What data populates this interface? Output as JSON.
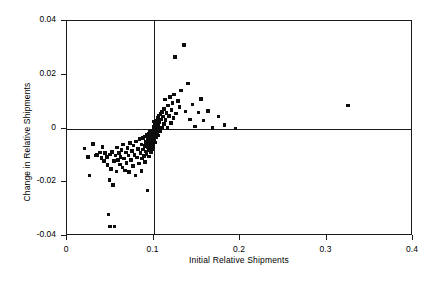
{
  "chart_data": {
    "type": "scatter",
    "title": "",
    "xlabel": "Initial Relative Shipments",
    "ylabel": "Change in Relative Shipments",
    "xlim": [
      0,
      0.4
    ],
    "ylim": [
      -0.04,
      0.04
    ],
    "xticks": [
      0,
      0.1,
      0.2,
      0.3,
      0.4
    ],
    "xticklabels": [
      "0",
      "0.1",
      "0.2",
      "0.3",
      "0.4"
    ],
    "yticks": [
      -0.04,
      -0.02,
      0,
      0.02,
      0.04
    ],
    "yticklabels": [
      "-0.04",
      "-0.02",
      "0",
      "0.02",
      "0.04"
    ],
    "grid": false,
    "legend": null,
    "marker": "square",
    "marker_color": "#0d0d0d",
    "reference_lines": [
      {
        "orientation": "vertical",
        "value": 0.1
      },
      {
        "orientation": "horizontal",
        "value": 0.0
      }
    ],
    "points": [
      [
        0.02,
        -0.0075
      ],
      [
        0.024,
        -0.0105
      ],
      [
        0.026,
        -0.0175
      ],
      [
        0.03,
        -0.0058
      ],
      [
        0.033,
        -0.01
      ],
      [
        0.035,
        -0.0098
      ],
      [
        0.038,
        -0.009
      ],
      [
        0.04,
        -0.011
      ],
      [
        0.041,
        -0.0068
      ],
      [
        0.043,
        -0.012
      ],
      [
        0.044,
        -0.0092
      ],
      [
        0.046,
        -0.0105
      ],
      [
        0.047,
        -0.0135
      ],
      [
        0.048,
        -0.032
      ],
      [
        0.049,
        -0.0192
      ],
      [
        0.05,
        -0.0365
      ],
      [
        0.05,
        -0.0096
      ],
      [
        0.051,
        -0.015
      ],
      [
        0.052,
        -0.0088
      ],
      [
        0.053,
        -0.021
      ],
      [
        0.054,
        -0.0122
      ],
      [
        0.055,
        -0.0365
      ],
      [
        0.056,
        -0.01
      ],
      [
        0.057,
        -0.016
      ],
      [
        0.058,
        -0.007
      ],
      [
        0.059,
        -0.0118
      ],
      [
        0.06,
        -0.0092
      ],
      [
        0.061,
        -0.0134
      ],
      [
        0.062,
        -0.0105
      ],
      [
        0.063,
        -0.008
      ],
      [
        0.064,
        -0.0145
      ],
      [
        0.065,
        -0.006
      ],
      [
        0.066,
        -0.0112
      ],
      [
        0.067,
        -0.0156
      ],
      [
        0.068,
        -0.009
      ],
      [
        0.069,
        -0.0128
      ],
      [
        0.07,
        -0.0072
      ],
      [
        0.071,
        -0.01
      ],
      [
        0.072,
        -0.0162
      ],
      [
        0.073,
        -0.0055
      ],
      [
        0.074,
        -0.0118
      ],
      [
        0.075,
        -0.0084
      ],
      [
        0.076,
        -0.014
      ],
      [
        0.077,
        -0.0064
      ],
      [
        0.078,
        -0.0098
      ],
      [
        0.079,
        -0.0175
      ],
      [
        0.08,
        -0.0048
      ],
      [
        0.081,
        -0.0108
      ],
      [
        0.082,
        -0.0076
      ],
      [
        0.083,
        -0.013
      ],
      [
        0.084,
        -0.004
      ],
      [
        0.085,
        -0.0092
      ],
      [
        0.086,
        -0.006
      ],
      [
        0.086,
        -0.0158
      ],
      [
        0.087,
        -0.0112
      ],
      [
        0.088,
        -0.0036
      ],
      [
        0.088,
        -0.0078
      ],
      [
        0.089,
        -0.0102
      ],
      [
        0.09,
        -0.003
      ],
      [
        0.09,
        -0.0066
      ],
      [
        0.09,
        -0.0125
      ],
      [
        0.091,
        -0.005
      ],
      [
        0.091,
        -0.0086
      ],
      [
        0.092,
        -0.0024
      ],
      [
        0.092,
        -0.0058
      ],
      [
        0.092,
        -0.0096
      ],
      [
        0.093,
        -0.004
      ],
      [
        0.093,
        -0.007
      ],
      [
        0.093,
        -0.023
      ],
      [
        0.094,
        -0.0018
      ],
      [
        0.094,
        -0.0052
      ],
      [
        0.094,
        -0.0082
      ],
      [
        0.095,
        -0.0032
      ],
      [
        0.095,
        -0.0062
      ],
      [
        0.095,
        -0.0104
      ],
      [
        0.096,
        -0.0012
      ],
      [
        0.096,
        -0.0044
      ],
      [
        0.096,
        -0.0074
      ],
      [
        0.097,
        -0.0026
      ],
      [
        0.097,
        -0.0056
      ],
      [
        0.097,
        -0.0088
      ],
      [
        0.098,
        -0.0008
      ],
      [
        0.098,
        -0.0038
      ],
      [
        0.098,
        -0.0066
      ],
      [
        0.099,
        -0.002
      ],
      [
        0.099,
        -0.0048
      ],
      [
        0.099,
        -0.0078
      ],
      [
        0.1,
        -0.0004
      ],
      [
        0.1,
        -0.003
      ],
      [
        0.1,
        -0.0058
      ],
      [
        0.1,
        0.0008
      ],
      [
        0.1,
        0.0026
      ],
      [
        0.101,
        -0.0014
      ],
      [
        0.101,
        -0.0042
      ],
      [
        0.101,
        0.0002
      ],
      [
        0.102,
        -0.0024
      ],
      [
        0.102,
        0.0014
      ],
      [
        0.102,
        -0.0052
      ],
      [
        0.103,
        -0.0006
      ],
      [
        0.103,
        0.002
      ],
      [
        0.103,
        -0.0034
      ],
      [
        0.104,
        0.0006
      ],
      [
        0.104,
        -0.0016
      ],
      [
        0.104,
        0.003
      ],
      [
        0.105,
        -0.0002
      ],
      [
        0.105,
        0.0038
      ],
      [
        0.105,
        -0.0026
      ],
      [
        0.106,
        0.0012
      ],
      [
        0.106,
        0.0046
      ],
      [
        0.107,
        0.0
      ],
      [
        0.107,
        0.0024
      ],
      [
        0.108,
        0.0054
      ],
      [
        0.108,
        -0.001
      ],
      [
        0.109,
        0.0034
      ],
      [
        0.11,
        0.0062
      ],
      [
        0.11,
        0.0004
      ],
      [
        0.111,
        0.0044
      ],
      [
        0.112,
        0.0016
      ],
      [
        0.112,
        0.0072
      ],
      [
        0.113,
        0.0108
      ],
      [
        0.114,
        0.0032
      ],
      [
        0.115,
        0.0058
      ],
      [
        0.116,
        0.0002
      ],
      [
        0.117,
        0.0086
      ],
      [
        0.118,
        0.0046
      ],
      [
        0.119,
        0.0118
      ],
      [
        0.12,
        0.002
      ],
      [
        0.121,
        0.0068
      ],
      [
        0.122,
        0.0094
      ],
      [
        0.123,
        0.004
      ],
      [
        0.124,
        0.0126
      ],
      [
        0.125,
        0.0265
      ],
      [
        0.126,
        0.0056
      ],
      [
        0.128,
        0.0102
      ],
      [
        0.13,
        0.008
      ],
      [
        0.132,
        0.0142
      ],
      [
        0.135,
        0.031
      ],
      [
        0.137,
        0.0064
      ],
      [
        0.14,
        0.0168
      ],
      [
        0.142,
        0.0034
      ],
      [
        0.145,
        0.009
      ],
      [
        0.148,
        0.0008
      ],
      [
        0.152,
        0.006
      ],
      [
        0.155,
        0.011
      ],
      [
        0.158,
        0.003
      ],
      [
        0.163,
        0.0066
      ],
      [
        0.168,
        0.0002
      ],
      [
        0.175,
        0.0044
      ],
      [
        0.182,
        0.0012
      ],
      [
        0.195,
        0.0
      ],
      [
        0.325,
        0.0085
      ]
    ]
  }
}
